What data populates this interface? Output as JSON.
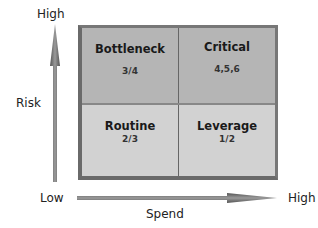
{
  "y_axis": {
    "label": "Risk",
    "high": "High"
  },
  "x_axis": {
    "label": "Spend",
    "low": "Low",
    "high": "High"
  },
  "quadrants": [
    {
      "name": "Bottleneck",
      "value": "3/4",
      "position": "top-left"
    },
    {
      "name": "Critical",
      "value": "4,5,6",
      "position": "top-right"
    },
    {
      "name": "Routine",
      "value": "2/3",
      "position": "bottom-left"
    },
    {
      "name": "Leverage",
      "value": "1/2",
      "position": "bottom-right"
    }
  ],
  "colors": {
    "top_cells": "#b5b5b5",
    "bottom_cells": "#d2d2d2",
    "border": "#6a6a6a",
    "arrow": "#707070"
  }
}
